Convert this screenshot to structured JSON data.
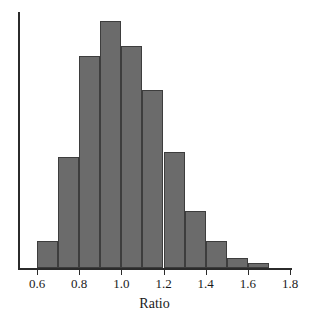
{
  "chart_data": {
    "type": "bar",
    "title": "",
    "subtitle": "",
    "xlabel": "Ratio",
    "ylabel": "",
    "xlim": [
      0.5,
      1.8
    ],
    "ylim": [
      0,
      100
    ],
    "grid": false,
    "legend": null,
    "bin_width": 0.1,
    "bar_color": "#6b6b6b",
    "bar_edge_color": "#3d3d3d",
    "axis_color": "#2b2b2b",
    "x_ticks": [
      {
        "value": 0.6,
        "label": "0.6"
      },
      {
        "value": 0.8,
        "label": "0.8"
      },
      {
        "value": 1.0,
        "label": "1.0"
      },
      {
        "value": 1.2,
        "label": "1.2"
      },
      {
        "value": 1.4,
        "label": "1.4"
      },
      {
        "value": 1.6,
        "label": "1.6"
      },
      {
        "value": 1.8,
        "label": "1.8"
      }
    ],
    "y_ticks": [],
    "bins": [
      {
        "start": 0.6,
        "end": 0.7,
        "value": 11
      },
      {
        "start": 0.7,
        "end": 0.8,
        "value": 45
      },
      {
        "start": 0.8,
        "end": 0.9,
        "value": 86
      },
      {
        "start": 0.9,
        "end": 1.0,
        "value": 100
      },
      {
        "start": 1.0,
        "end": 1.1,
        "value": 90
      },
      {
        "start": 1.1,
        "end": 1.2,
        "value": 72
      },
      {
        "start": 1.2,
        "end": 1.3,
        "value": 47
      },
      {
        "start": 1.3,
        "end": 1.4,
        "value": 23
      },
      {
        "start": 1.4,
        "end": 1.5,
        "value": 11
      },
      {
        "start": 1.5,
        "end": 1.6,
        "value": 4
      },
      {
        "start": 1.6,
        "end": 1.7,
        "value": 2
      }
    ],
    "categories": [
      "0.6-0.7",
      "0.7-0.8",
      "0.8-0.9",
      "0.9-1.0",
      "1.0-1.1",
      "1.1-1.2",
      "1.2-1.3",
      "1.3-1.4",
      "1.4-1.5",
      "1.5-1.6",
      "1.6-1.7"
    ],
    "values": [
      11,
      45,
      86,
      100,
      90,
      72,
      47,
      23,
      11,
      4,
      2
    ]
  }
}
